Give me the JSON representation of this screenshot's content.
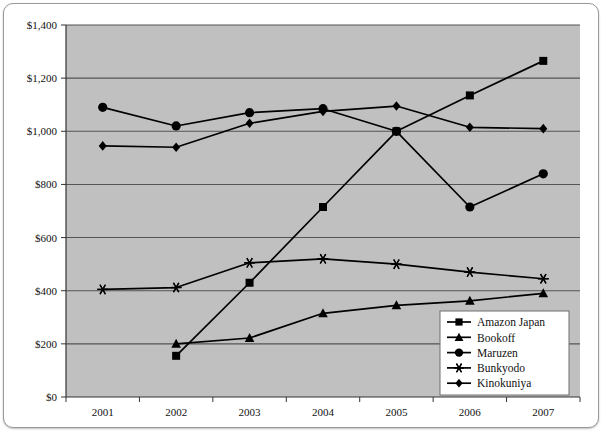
{
  "chart_data": {
    "type": "line",
    "title": "",
    "xlabel": "",
    "ylabel": "",
    "categories": [
      "2001",
      "2002",
      "2003",
      "2004",
      "2005",
      "2006",
      "2007"
    ],
    "x_tick_labels": [
      "2001",
      "2002",
      "2003",
      "2004",
      "2005",
      "2006",
      "2007"
    ],
    "y_tick_labels": [
      "$0",
      "$200",
      "$400",
      "$600",
      "$800",
      "$1,000",
      "$1,200",
      "$1,400"
    ],
    "y_tick_values": [
      0,
      200,
      400,
      600,
      800,
      1000,
      1200,
      1400
    ],
    "ylim": [
      0,
      1400
    ],
    "grid": "horizontal",
    "legend_position": "inside-bottom-right",
    "plot_background": "#c0c0c0",
    "gridline_color": "#555555",
    "series": [
      {
        "name": "Amazon Japan",
        "marker": "square",
        "color": "#000000",
        "values": [
          null,
          155,
          430,
          715,
          1000,
          1135,
          1265
        ]
      },
      {
        "name": "Bookoff",
        "marker": "triangle",
        "color": "#000000",
        "values": [
          null,
          200,
          222,
          315,
          345,
          362,
          390
        ]
      },
      {
        "name": "Maruzen",
        "marker": "circle",
        "color": "#000000",
        "values": [
          1090,
          1020,
          1070,
          1085,
          1000,
          715,
          840
        ]
      },
      {
        "name": "Bunkyodo",
        "marker": "asterisk",
        "color": "#000000",
        "values": [
          405,
          412,
          505,
          520,
          500,
          470,
          445
        ]
      },
      {
        "name": "Kinokuniya",
        "marker": "diamond",
        "color": "#000000",
        "values": [
          945,
          940,
          1030,
          1075,
          1095,
          1015,
          1010
        ]
      }
    ]
  },
  "legend": {
    "items": [
      {
        "label": "Amazon Japan",
        "marker": "square"
      },
      {
        "label": "Bookoff",
        "marker": "triangle"
      },
      {
        "label": "Maruzen",
        "marker": "circle"
      },
      {
        "label": "Bunkyodo",
        "marker": "asterisk"
      },
      {
        "label": "Kinokuniya",
        "marker": "diamond"
      }
    ]
  }
}
